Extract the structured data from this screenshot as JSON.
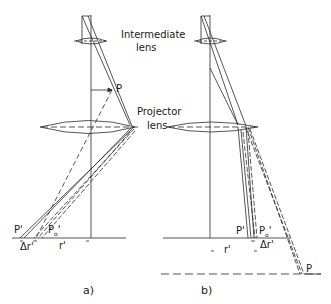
{
  "labels": {
    "intermediate_lens_1": "Intermediate",
    "intermediate_lens_2": "lens",
    "projector_lens_1": "Projector",
    "projector_lens_2": "lens",
    "a": {
      "point_P": "P",
      "point_P_prime": "P'",
      "point_P0_prime_main": "P",
      "point_P0_prime_sub": "o",
      "point_P0_prime_tick": "'",
      "delta_r": "Δr'",
      "r_prime": "r'",
      "caption": "a)"
    },
    "b": {
      "point_P": "P",
      "point_P_prime": "P'",
      "point_P0_prime_main": "P",
      "point_P0_prime_sub": "o",
      "point_P0_prime_tick": "'",
      "delta_r": "Δr'",
      "r_prime": "r'",
      "caption": "b)"
    }
  },
  "colors": {
    "line": "#2a2a2a",
    "background": "#ffffff"
  }
}
